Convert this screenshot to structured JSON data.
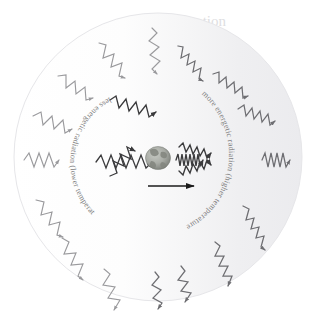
{
  "figure": {
    "name": "doppler-radiation-diagram",
    "background_color": "#ffffff",
    "disc": {
      "name": "radiation-field-disc",
      "center_x": 158,
      "center_y": 157,
      "radius": 144,
      "outline_color": "#e3e3e6",
      "fill_left_color": "#fdfdfd",
      "fill_right_color": "#efeff1"
    },
    "center_body": {
      "name": "earth-globe",
      "label": "Earth",
      "center_x": 158,
      "center_y": 158,
      "radius_x": 12,
      "radius_y": 11,
      "ocean_color": "#b0b3ae",
      "land_color": "#8d9089",
      "shadow_color": "#6f726d"
    },
    "motion_arrow": {
      "name": "motion-direction-arrow",
      "label": "direction of motion",
      "x1": 148,
      "y1": 186,
      "x2": 196,
      "y2": 186,
      "color": "#1b1b1b"
    },
    "labels": {
      "left_arc": "less energetic radiation (lower temperature)",
      "right_arc": "more energetic radiation (higher temperature)",
      "text_color": "#7e7e80"
    },
    "waves": {
      "long_wavelength_color": "#9a9a9d",
      "short_wavelength_color": "#6e6e72",
      "inner_wave_color": "#3a3a3c",
      "left_side_note": "stretched long-wavelength redshifted waves",
      "right_side_note": "compressed short-wavelength blueshifted waves"
    },
    "bleed_through": {
      "name": "page-bleed-through-text",
      "color": "#d9d9dc",
      "lines": [
        "ation",
        "of the",
        "niversity",
        "s collected",
        "on contain",
        "ergy range",
        "m 10 to 100",
        "ndred",
        "s",
        "mperature",
        "s and",
        "ss, and on of the",
        "s and sizes",
        "nal form",
        "se differ",
        "ces for the"
      ]
    }
  }
}
